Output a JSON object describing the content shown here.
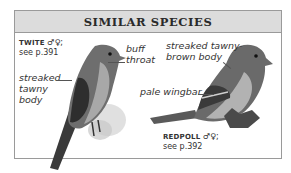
{
  "header": {
    "title": "SIMILAR SPECIES"
  },
  "species": [
    {
      "name": "TWITE",
      "sex_symbols": "♂♀;",
      "page_ref": "see p.391",
      "labels": [
        "buff throat",
        "streaked tawny body"
      ],
      "label_lines": {
        "buff": "buff",
        "throat": "throat",
        "streaked": "streaked",
        "tawny": "tawny",
        "body": "body"
      }
    },
    {
      "name": "REDPOLL",
      "sex_symbols": "♂♀;",
      "page_ref": "see p.392",
      "labels": [
        "streaked tawny-brown body",
        "pale wingbar"
      ],
      "label_lines": {
        "line1": "streaked tawny-",
        "line2": "brown body",
        "wingbar": "pale wingbar"
      }
    }
  ],
  "colors": {
    "header_bg": "#dcdcdc",
    "border": "#9a9a9a",
    "text": "#333333"
  }
}
